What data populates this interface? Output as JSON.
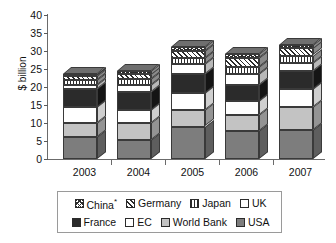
{
  "chart_data": {
    "type": "bar",
    "subtype": "stacked-column-3d",
    "title": "",
    "xlabel": "",
    "ylabel": "$ billion",
    "ylim": [
      0,
      40
    ],
    "yticks": [
      0,
      5,
      10,
      15,
      20,
      25,
      30,
      35,
      40
    ],
    "grid": false,
    "legend_position": "bottom",
    "categories": [
      "2003",
      "2004",
      "2005",
      "2006",
      "2007"
    ],
    "stack_order_bottom_to_top": [
      "USA",
      "World Bank",
      "EC",
      "France",
      "UK",
      "Japan",
      "Germany",
      "China*"
    ],
    "series": [
      {
        "name": "USA",
        "values": [
          6.0,
          5.3,
          9.0,
          7.8,
          8.0
        ]
      },
      {
        "name": "World Bank",
        "values": [
          4.0,
          4.7,
          4.5,
          4.5,
          6.5
        ]
      },
      {
        "name": "EC",
        "values": [
          4.5,
          3.5,
          4.7,
          3.9,
          5.0
        ]
      },
      {
        "name": "France",
        "values": [
          5.0,
          5.0,
          5.3,
          4.4,
          5.0
        ]
      },
      {
        "name": "UK",
        "values": [
          1.0,
          2.0,
          2.8,
          3.0,
          2.2
        ]
      },
      {
        "name": "Japan",
        "values": [
          1.5,
          1.7,
          1.7,
          2.0,
          2.0
        ]
      },
      {
        "name": "Germany",
        "values": [
          1.0,
          1.3,
          2.0,
          2.5,
          2.0
        ]
      },
      {
        "name": "China*",
        "values": [
          0.5,
          1.0,
          1.0,
          1.0,
          1.0
        ]
      }
    ],
    "totals": [
      23.5,
      24.5,
      31.0,
      29.1,
      31.7
    ]
  },
  "axis": {
    "y_title": "$ billion",
    "y_ticks": [
      "40",
      "35",
      "30",
      "25",
      "20",
      "15",
      "10",
      "5",
      "0"
    ],
    "x_labels": [
      "2003",
      "2004",
      "2005",
      "2006",
      "2007"
    ]
  },
  "legend": {
    "row1": [
      {
        "label": "China*",
        "pattern": "checker",
        "color": "#ffffff"
      },
      {
        "label": "Germany",
        "pattern": "diagonal-stripes",
        "color": "#ffffff"
      },
      {
        "label": "Japan",
        "pattern": "vertical-stripes",
        "color": "#ffffff"
      },
      {
        "label": "UK",
        "pattern": "dots",
        "color": "#ffffff"
      }
    ],
    "row2": [
      {
        "label": "France",
        "pattern": "solid",
        "color": "#2b2b2b"
      },
      {
        "label": "EC",
        "pattern": "solid",
        "color": "#ffffff"
      },
      {
        "label": "World Bank",
        "pattern": "solid",
        "color": "#c3c3c3"
      },
      {
        "label": "USA",
        "pattern": "solid",
        "color": "#7d7d7d"
      }
    ]
  }
}
